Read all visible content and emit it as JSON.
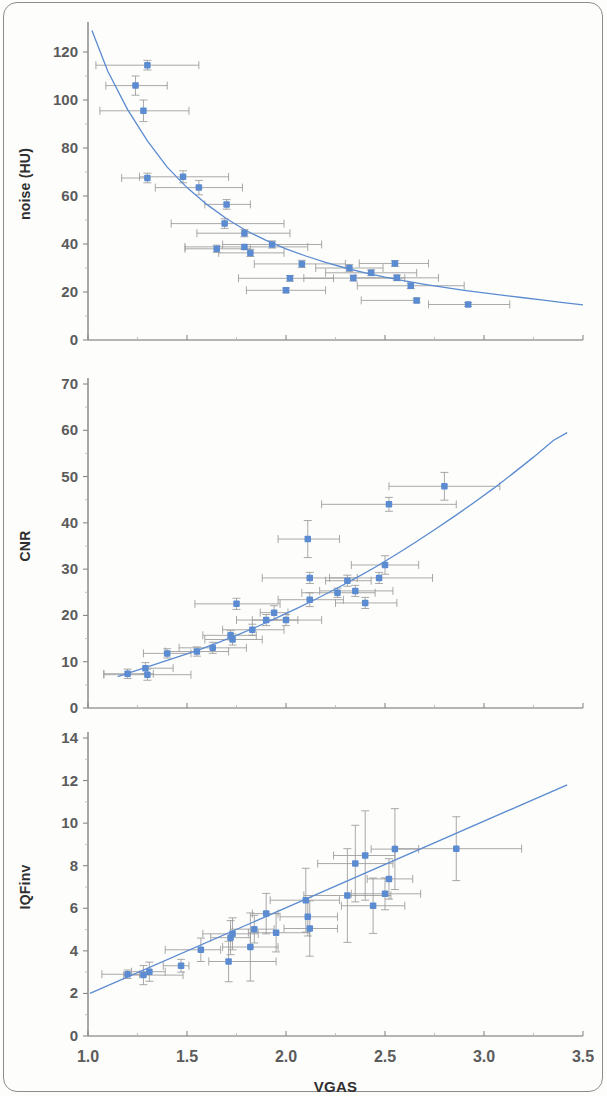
{
  "figure": {
    "kind": "multi-panel-scatter-figure",
    "panel_count": 3,
    "marker_color": "#5b8bd0",
    "trend_color": "#5b8bd0",
    "error_bar_color": "#9a9a9a",
    "shared_xlabel": "VGAS",
    "shared_xticks": [
      "1.0",
      "1.5",
      "2.0",
      "2.5",
      "3.0",
      "3.5"
    ]
  },
  "chart_data": [
    {
      "id": "noise-panel",
      "type": "scatter",
      "title": "",
      "xlabel": "",
      "ylabel": "noise (HU)",
      "xlim": [
        1.0,
        3.5
      ],
      "ylim": [
        0,
        130
      ],
      "xticks": [
        1.0,
        1.5,
        2.0,
        2.5,
        3.0,
        3.5
      ],
      "xticklabels": [
        "1.0",
        "1.5",
        "2.0",
        "2.5",
        "3.0",
        "3.5"
      ],
      "xticklabels_visible": false,
      "yticks": [
        0,
        20,
        40,
        60,
        80,
        100,
        120
      ],
      "yticklabels": [
        "0",
        "20",
        "40",
        "60",
        "80",
        "100",
        "120"
      ],
      "grid": false,
      "legend": "none",
      "trend": {
        "kind": "power-decay",
        "description": "decreasing curve fit through noise vs VGAS",
        "points": [
          [
            1.02,
            129.0
          ],
          [
            1.1,
            112.0
          ],
          [
            1.2,
            96.0
          ],
          [
            1.3,
            83.0
          ],
          [
            1.4,
            72.0
          ],
          [
            1.5,
            63.5
          ],
          [
            1.6,
            56.5
          ],
          [
            1.7,
            50.5
          ],
          [
            1.8,
            45.5
          ],
          [
            1.9,
            41.5
          ],
          [
            2.0,
            38.0
          ],
          [
            2.1,
            35.0
          ],
          [
            2.2,
            32.3
          ],
          [
            2.3,
            30.0
          ],
          [
            2.4,
            28.0
          ],
          [
            2.5,
            26.2
          ],
          [
            2.6,
            24.6
          ],
          [
            2.7,
            23.2
          ],
          [
            2.8,
            21.9
          ],
          [
            2.9,
            20.7
          ],
          [
            3.0,
            19.6
          ],
          [
            3.1,
            18.6
          ],
          [
            3.2,
            17.6
          ],
          [
            3.3,
            16.6
          ],
          [
            3.4,
            15.6
          ],
          [
            3.5,
            14.6
          ]
        ]
      },
      "points": [
        {
          "x": 1.3,
          "y": 114.5,
          "xerr_low": 0.26,
          "xerr_high": 0.26,
          "yerr": 2.0
        },
        {
          "x": 1.24,
          "y": 106.0,
          "xerr_low": 0.15,
          "xerr_high": 0.16,
          "yerr": 4.0
        },
        {
          "x": 1.28,
          "y": 95.5,
          "xerr_low": 0.22,
          "xerr_high": 0.23,
          "yerr": 4.5
        },
        {
          "x": 1.3,
          "y": 67.5,
          "xerr_low": 0.13,
          "xerr_high": 0.0,
          "yerr": 2.0
        },
        {
          "x": 1.48,
          "y": 68.0,
          "xerr_low": 0.22,
          "xerr_high": 0.23,
          "yerr": 2.5
        },
        {
          "x": 1.56,
          "y": 63.5,
          "xerr_low": 0.22,
          "xerr_high": 0.22,
          "yerr": 3.0
        },
        {
          "x": 1.7,
          "y": 56.5,
          "xerr_low": 0.11,
          "xerr_high": 0.12,
          "yerr": 2.0
        },
        {
          "x": 1.69,
          "y": 48.5,
          "xerr_low": 0.27,
          "xerr_high": 0.3,
          "yerr": 2.0
        },
        {
          "x": 1.79,
          "y": 44.5,
          "xerr_low": 0.24,
          "xerr_high": 0.23,
          "yerr": 1.5
        },
        {
          "x": 1.93,
          "y": 39.8,
          "xerr_low": 0.25,
          "xerr_high": 0.25,
          "yerr": 1.5
        },
        {
          "x": 1.79,
          "y": 38.8,
          "xerr_low": 0.3,
          "xerr_high": 0.32,
          "yerr": 1.0
        },
        {
          "x": 1.65,
          "y": 38.0,
          "xerr_low": 0.16,
          "xerr_high": 0.17,
          "yerr": 1.5
        },
        {
          "x": 1.82,
          "y": 36.3,
          "xerr_low": 0.16,
          "xerr_high": 0.17,
          "yerr": 1.5
        },
        {
          "x": 2.08,
          "y": 31.7,
          "xerr_low": 0.24,
          "xerr_high": 0.22,
          "yerr": 1.5
        },
        {
          "x": 2.32,
          "y": 30.0,
          "xerr_low": 0.17,
          "xerr_high": 0.17,
          "yerr": 1.5
        },
        {
          "x": 2.55,
          "y": 31.9,
          "xerr_low": 0.18,
          "xerr_high": 0.17,
          "yerr": 1.2
        },
        {
          "x": 2.43,
          "y": 28.0,
          "xerr_low": 0.23,
          "xerr_high": 0.23,
          "yerr": 1.2
        },
        {
          "x": 2.34,
          "y": 25.8,
          "xerr_low": 0.25,
          "xerr_high": 0.26,
          "yerr": 1.2
        },
        {
          "x": 2.56,
          "y": 25.9,
          "xerr_low": 0.21,
          "xerr_high": 0.21,
          "yerr": 1.2
        },
        {
          "x": 2.02,
          "y": 25.7,
          "xerr_low": 0.26,
          "xerr_high": 0.22,
          "yerr": 1.2
        },
        {
          "x": 2.63,
          "y": 22.6,
          "xerr_low": 0.27,
          "xerr_high": 0.27,
          "yerr": 1.2
        },
        {
          "x": 2.0,
          "y": 20.7,
          "xerr_low": 0.2,
          "xerr_high": 0.2,
          "yerr": 1.0
        },
        {
          "x": 2.66,
          "y": 16.5,
          "xerr_low": 0.28,
          "xerr_high": 0.0,
          "yerr": 1.0
        },
        {
          "x": 2.92,
          "y": 14.8,
          "xerr_low": 0.2,
          "xerr_high": 0.21,
          "yerr": 0.8
        }
      ]
    },
    {
      "id": "cnr-panel",
      "type": "scatter",
      "title": "",
      "xlabel": "",
      "ylabel": "CNR",
      "xlim": [
        1.0,
        3.5
      ],
      "ylim": [
        0,
        70
      ],
      "xticks": [
        1.0,
        1.5,
        2.0,
        2.5,
        3.0,
        3.5
      ],
      "xticklabels": [
        "1.0",
        "1.5",
        "2.0",
        "2.5",
        "3.0",
        "3.5"
      ],
      "xticklabels_visible": false,
      "yticks": [
        0,
        10,
        20,
        30,
        40,
        50,
        60,
        70
      ],
      "yticklabels": [
        "0",
        "10",
        "20",
        "30",
        "40",
        "50",
        "60",
        "70"
      ],
      "grid": false,
      "legend": "none",
      "trend": {
        "kind": "power-growth",
        "description": "increasing curve fit through CNR vs VGAS",
        "points": [
          [
            1.15,
            6.8
          ],
          [
            1.25,
            8.2
          ],
          [
            1.35,
            9.6
          ],
          [
            1.45,
            11.0
          ],
          [
            1.55,
            12.4
          ],
          [
            1.65,
            14.0
          ],
          [
            1.75,
            15.7
          ],
          [
            1.85,
            17.5
          ],
          [
            1.95,
            19.4
          ],
          [
            2.05,
            21.4
          ],
          [
            2.15,
            23.5
          ],
          [
            2.25,
            25.7
          ],
          [
            2.35,
            28.0
          ],
          [
            2.45,
            30.4
          ],
          [
            2.55,
            33.0
          ],
          [
            2.65,
            35.7
          ],
          [
            2.75,
            38.5
          ],
          [
            2.85,
            41.4
          ],
          [
            2.95,
            44.4
          ],
          [
            3.05,
            47.5
          ],
          [
            3.15,
            50.8
          ],
          [
            3.25,
            54.2
          ],
          [
            3.35,
            57.8
          ],
          [
            3.42,
            59.5
          ]
        ]
      },
      "points": [
        {
          "x": 1.2,
          "y": 7.4,
          "xerr_low": 0.12,
          "xerr_high": 0.13,
          "yerr": 1.0
        },
        {
          "x": 1.29,
          "y": 8.6,
          "xerr_low": 0.0,
          "xerr_high": 0.14,
          "yerr": 1.2
        },
        {
          "x": 1.3,
          "y": 7.2,
          "xerr_low": 0.22,
          "xerr_high": 0.22,
          "yerr": 1.2
        },
        {
          "x": 1.4,
          "y": 11.8,
          "xerr_low": 0.12,
          "xerr_high": 0.12,
          "yerr": 1.0
        },
        {
          "x": 1.55,
          "y": 12.2,
          "xerr_low": 0.16,
          "xerr_high": 0.16,
          "yerr": 1.0
        },
        {
          "x": 1.63,
          "y": 13.0,
          "xerr_low": 0.17,
          "xerr_high": 0.17,
          "yerr": 1.2
        },
        {
          "x": 1.72,
          "y": 15.7,
          "xerr_low": 0.14,
          "xerr_high": 0.13,
          "yerr": 1.0
        },
        {
          "x": 1.73,
          "y": 14.8,
          "xerr_low": 0.14,
          "xerr_high": 0.15,
          "yerr": 1.2
        },
        {
          "x": 1.75,
          "y": 22.5,
          "xerr_low": 0.21,
          "xerr_high": 0.22,
          "yerr": 1.2
        },
        {
          "x": 1.83,
          "y": 16.9,
          "xerr_low": 0.15,
          "xerr_high": 0.16,
          "yerr": 1.2
        },
        {
          "x": 1.9,
          "y": 19.0,
          "xerr_low": 0.15,
          "xerr_high": 0.16,
          "yerr": 1.2
        },
        {
          "x": 1.94,
          "y": 20.6,
          "xerr_low": 0.07,
          "xerr_high": 0.07,
          "yerr": 1.5
        },
        {
          "x": 2.0,
          "y": 19.0,
          "xerr_low": 0.17,
          "xerr_high": 0.18,
          "yerr": 1.2
        },
        {
          "x": 2.12,
          "y": 28.1,
          "xerr_low": 0.24,
          "xerr_high": 0.24,
          "yerr": 1.2
        },
        {
          "x": 2.11,
          "y": 36.5,
          "xerr_low": 0.15,
          "xerr_high": 0.16,
          "yerr": 4.0
        },
        {
          "x": 2.12,
          "y": 23.4,
          "xerr_low": 0.16,
          "xerr_high": 0.17,
          "yerr": 1.5
        },
        {
          "x": 2.26,
          "y": 24.9,
          "xerr_low": 0.18,
          "xerr_high": 0.19,
          "yerr": 1.0
        },
        {
          "x": 2.31,
          "y": 27.5,
          "xerr_low": 0.11,
          "xerr_high": 0.12,
          "yerr": 1.2
        },
        {
          "x": 2.35,
          "y": 25.3,
          "xerr_low": 0.18,
          "xerr_high": 0.19,
          "yerr": 1.2
        },
        {
          "x": 2.4,
          "y": 22.7,
          "xerr_low": 0.15,
          "xerr_high": 0.16,
          "yerr": 1.2
        },
        {
          "x": 2.47,
          "y": 28.1,
          "xerr_low": 0.25,
          "xerr_high": 0.27,
          "yerr": 1.2
        },
        {
          "x": 2.5,
          "y": 30.9,
          "xerr_low": 0.17,
          "xerr_high": 0.17,
          "yerr": 2.0
        },
        {
          "x": 2.52,
          "y": 44.0,
          "xerr_low": 0.34,
          "xerr_high": 0.34,
          "yerr": 1.5
        },
        {
          "x": 2.8,
          "y": 47.9,
          "xerr_low": 0.28,
          "xerr_high": 0.28,
          "yerr": 3.0
        }
      ]
    },
    {
      "id": "iqfinv-panel",
      "type": "scatter",
      "title": "",
      "xlabel": "VGAS",
      "ylabel": "IQFinv",
      "xlim": [
        1.0,
        3.5
      ],
      "ylim": [
        0,
        14
      ],
      "xticks": [
        1.0,
        1.5,
        2.0,
        2.5,
        3.0,
        3.5
      ],
      "xticklabels": [
        "1.0",
        "1.5",
        "2.0",
        "2.5",
        "3.0",
        "3.5"
      ],
      "xticklabels_visible": true,
      "yticks": [
        0,
        2,
        4,
        6,
        8,
        10,
        12,
        14
      ],
      "yticklabels": [
        "0",
        "2",
        "4",
        "6",
        "8",
        "10",
        "12",
        "14"
      ],
      "grid": false,
      "legend": "none",
      "trend": {
        "kind": "linear",
        "description": "increasing near-linear fit through IQFinv vs VGAS",
        "points": [
          [
            1.01,
            2.0
          ],
          [
            3.42,
            11.8
          ]
        ]
      },
      "points": [
        {
          "x": 1.2,
          "y": 2.9,
          "xerr_low": 0.13,
          "xerr_high": 0.06,
          "yerr": 0.2
        },
        {
          "x": 1.28,
          "y": 2.86,
          "xerr_low": 0.1,
          "xerr_high": 0.2,
          "yerr": 0.45
        },
        {
          "x": 1.31,
          "y": 3.02,
          "xerr_low": 0.09,
          "xerr_high": 0.08,
          "yerr": 0.45
        },
        {
          "x": 1.47,
          "y": 3.3,
          "xerr_low": 0.09,
          "xerr_high": 0.04,
          "yerr": 0.3
        },
        {
          "x": 1.57,
          "y": 4.05,
          "xerr_low": 0.18,
          "xerr_high": 0.1,
          "yerr": 0.55
        },
        {
          "x": 1.71,
          "y": 3.5,
          "xerr_low": 0.1,
          "xerr_high": 0.24,
          "yerr": 0.95
        },
        {
          "x": 1.72,
          "y": 4.62,
          "xerr_low": 0.1,
          "xerr_high": 0.1,
          "yerr": 0.8
        },
        {
          "x": 1.73,
          "y": 4.8,
          "xerr_low": 0.15,
          "xerr_high": 0.13,
          "yerr": 0.75
        },
        {
          "x": 1.82,
          "y": 4.18,
          "xerr_low": 0.14,
          "xerr_high": 0.14,
          "yerr": 1.6
        },
        {
          "x": 1.84,
          "y": 5.02,
          "xerr_low": 0.12,
          "xerr_high": 0.1,
          "yerr": 0.65
        },
        {
          "x": 1.9,
          "y": 5.75,
          "xerr_low": 0.07,
          "xerr_high": 0.06,
          "yerr": 0.95
        },
        {
          "x": 1.95,
          "y": 4.85,
          "xerr_low": 0.14,
          "xerr_high": 0.17,
          "yerr": 0.9
        },
        {
          "x": 2.1,
          "y": 6.38,
          "xerr_low": 0.18,
          "xerr_high": 0.17,
          "yerr": 1.5
        },
        {
          "x": 2.11,
          "y": 5.6,
          "xerr_low": 0.14,
          "xerr_high": 0.15,
          "yerr": 0.9
        },
        {
          "x": 2.12,
          "y": 5.05,
          "xerr_low": 0.13,
          "xerr_high": 0.14,
          "yerr": 1.3
        },
        {
          "x": 2.31,
          "y": 6.6,
          "xerr_low": 0.22,
          "xerr_high": 0.22,
          "yerr": 2.2
        },
        {
          "x": 2.35,
          "y": 8.1,
          "xerr_low": 0.19,
          "xerr_high": 0.19,
          "yerr": 1.8
        },
        {
          "x": 2.4,
          "y": 8.48,
          "xerr_low": 0.16,
          "xerr_high": 0.15,
          "yerr": 2.1
        },
        {
          "x": 2.44,
          "y": 6.12,
          "xerr_low": 0.16,
          "xerr_high": 0.16,
          "yerr": 1.3
        },
        {
          "x": 2.5,
          "y": 6.68,
          "xerr_low": 0.17,
          "xerr_high": 0.18,
          "yerr": 0.75
        },
        {
          "x": 2.52,
          "y": 7.38,
          "xerr_low": 0.11,
          "xerr_high": 0.12,
          "yerr": 0.95
        },
        {
          "x": 2.55,
          "y": 8.78,
          "xerr_low": 0.12,
          "xerr_high": 0.12,
          "yerr": 1.9
        },
        {
          "x": 2.86,
          "y": 8.8,
          "xerr_low": 0.31,
          "xerr_high": 0.33,
          "yerr": 1.5
        }
      ]
    }
  ]
}
